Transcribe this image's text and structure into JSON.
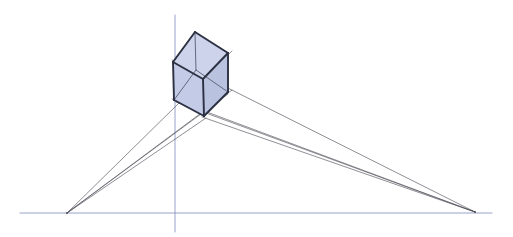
{
  "figure": {
    "type": "line-drawing",
    "canvas": {
      "width": 513,
      "height": 237,
      "background": "#ffffff"
    },
    "colors": {
      "horizon_line": "#8a93bf",
      "vertical_axis": "#8a93bf",
      "construction_ray": "#4c4c58",
      "cube_edge": "#2b3042",
      "cube_edge_hidden": "#5d6478",
      "cube_face_front_left": "#c3cbe6",
      "cube_face_front_right": "#b9c2de",
      "cube_face_top": "#ccd3ea"
    },
    "guides": {
      "horizon": {
        "label": "horizon line",
        "x1": 20,
        "y1": 213,
        "x2": 492,
        "y2": 213,
        "width": 1
      },
      "vertical": {
        "label": "vertical axis",
        "x1": 175,
        "y1": 15,
        "x2": 175,
        "y2": 232,
        "width": 1
      }
    },
    "vanishing_points": [
      {
        "name": "left-vanishing-point",
        "label": "VP left",
        "x": 67,
        "y": 213
      },
      {
        "name": "right-vanishing-point",
        "label": "VP right",
        "x": 475,
        "y": 212
      }
    ],
    "cube_vertices": {
      "top": {
        "label": "top-back",
        "x": 195,
        "y": 32
      },
      "top_left": {
        "label": "top-left",
        "x": 173,
        "y": 62
      },
      "top_right": {
        "label": "top-right",
        "x": 228,
        "y": 53
      },
      "top_front": {
        "label": "top-front",
        "x": 203,
        "y": 79
      },
      "bottom_left": {
        "label": "bottom-left",
        "x": 174,
        "y": 100
      },
      "bottom_right": {
        "label": "bottom-right",
        "x": 228,
        "y": 92
      },
      "bottom_front": {
        "label": "bottom-front",
        "x": 204,
        "y": 116
      },
      "bottom_back": {
        "label": "bottom-back-hidden",
        "x": 196,
        "y": 70
      }
    },
    "construction_rays_left": [
      {
        "name": "ray-left-to-top-left",
        "x1": 67,
        "y1": 213,
        "x2": 232,
        "y2": 51
      },
      {
        "name": "ray-left-to-bottom-left",
        "x1": 67,
        "y1": 213,
        "x2": 232,
        "y2": 90
      },
      {
        "name": "ray-left-to-bottom-back",
        "x1": 67,
        "y1": 213,
        "x2": 228,
        "y2": 94
      },
      {
        "name": "ray-left-to-bottom-front",
        "x1": 67,
        "y1": 213,
        "x2": 206,
        "y2": 118
      }
    ],
    "construction_rays_right": [
      {
        "name": "ray-right-to-top-right",
        "x1": 475,
        "y1": 212,
        "x2": 172,
        "y2": 60
      },
      {
        "name": "ray-right-to-bottom-right",
        "x1": 475,
        "y1": 212,
        "x2": 172,
        "y2": 99
      },
      {
        "name": "ray-right-to-bottom-back",
        "x1": 475,
        "y1": 212,
        "x2": 176,
        "y2": 102
      },
      {
        "name": "ray-right-to-bottom-front",
        "x1": 475,
        "y1": 212,
        "x2": 202,
        "y2": 117
      }
    ],
    "cube_faces": [
      {
        "name": "cube-face-top",
        "label": "top face",
        "points": "195,32 173,62 203,79 228,53",
        "fill": "#ccd3ea"
      },
      {
        "name": "cube-face-front-left",
        "label": "front-left face",
        "points": "173,62 174,100 204,116 203,79",
        "fill": "#c3cbe6"
      },
      {
        "name": "cube-face-front-right",
        "label": "front-right face",
        "points": "203,79 204,116 228,92 228,53",
        "fill": "#b9c2de"
      }
    ],
    "cube_edges_visible": [
      {
        "name": "edge-top-to-top-left",
        "x1": 195,
        "y1": 32,
        "x2": 173,
        "y2": 62
      },
      {
        "name": "edge-top-to-top-right",
        "x1": 195,
        "y1": 32,
        "x2": 228,
        "y2": 53
      },
      {
        "name": "edge-top-left-to-top-front",
        "x1": 173,
        "y1": 62,
        "x2": 203,
        "y2": 79
      },
      {
        "name": "edge-top-right-to-top-front",
        "x1": 228,
        "y1": 53,
        "x2": 203,
        "y2": 79
      },
      {
        "name": "edge-vertical-left",
        "x1": 173,
        "y1": 62,
        "x2": 174,
        "y2": 100
      },
      {
        "name": "edge-vertical-front",
        "x1": 203,
        "y1": 79,
        "x2": 204,
        "y2": 116
      },
      {
        "name": "edge-vertical-right",
        "x1": 228,
        "y1": 53,
        "x2": 228,
        "y2": 92
      },
      {
        "name": "edge-bottom-left-front",
        "x1": 174,
        "y1": 100,
        "x2": 204,
        "y2": 116
      },
      {
        "name": "edge-bottom-front-right",
        "x1": 204,
        "y1": 116,
        "x2": 228,
        "y2": 92
      }
    ],
    "cube_edges_hidden": [
      {
        "name": "edge-hidden-vertical-back",
        "x1": 195,
        "y1": 32,
        "x2": 196,
        "y2": 70
      },
      {
        "name": "edge-hidden-bottom-left-back",
        "x1": 174,
        "y1": 100,
        "x2": 196,
        "y2": 70
      },
      {
        "name": "edge-hidden-bottom-back-right",
        "x1": 196,
        "y1": 70,
        "x2": 228,
        "y2": 92
      }
    ]
  }
}
